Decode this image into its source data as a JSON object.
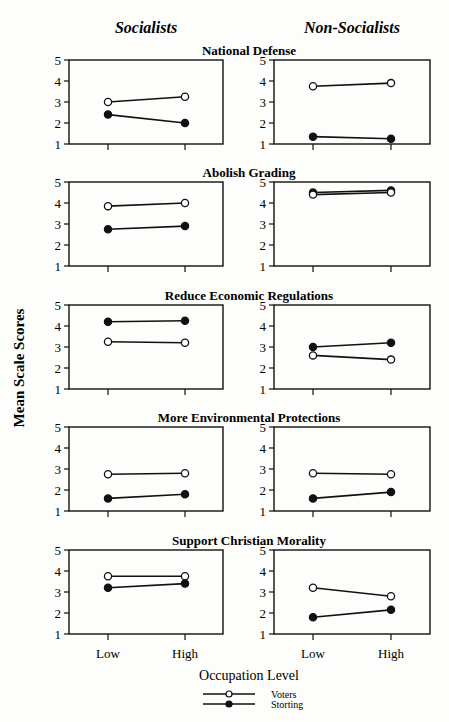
{
  "chart_data": {
    "type": "line",
    "ylabel": "Mean Scale Scores",
    "xlabel": "Occupation Level",
    "categories": [
      "Low",
      "High"
    ],
    "ylim": [
      1,
      5
    ],
    "yticks": [
      1,
      2,
      3,
      4,
      5
    ],
    "columns": [
      "Socialists",
      "Non-Socialists"
    ],
    "legend": [
      {
        "name": "Voters",
        "marker": "open-circle"
      },
      {
        "name": "Storting",
        "marker": "filled-circle"
      }
    ],
    "panels": [
      {
        "title": "National Defense",
        "Socialists": {
          "Voters": [
            3.0,
            3.25
          ],
          "Storting": [
            2.4,
            2.0
          ]
        },
        "Non-Socialists": {
          "Voters": [
            3.75,
            3.9
          ],
          "Storting": [
            1.35,
            1.25
          ]
        }
      },
      {
        "title": "Abolish Grading",
        "Socialists": {
          "Voters": [
            3.85,
            4.0
          ],
          "Storting": [
            2.75,
            2.9
          ]
        },
        "Non-Socialists": {
          "Voters": [
            4.4,
            4.5
          ],
          "Storting": [
            4.5,
            4.6
          ]
        }
      },
      {
        "title": "Reduce Economic Regulations",
        "Socialists": {
          "Voters": [
            3.25,
            3.2
          ],
          "Storting": [
            4.2,
            4.25
          ]
        },
        "Non-Socialists": {
          "Voters": [
            2.6,
            2.4
          ],
          "Storting": [
            3.0,
            3.2
          ]
        }
      },
      {
        "title": "More Environmental Protections",
        "Socialists": {
          "Voters": [
            2.75,
            2.8
          ],
          "Storting": [
            1.6,
            1.8
          ]
        },
        "Non-Socialists": {
          "Voters": [
            2.8,
            2.75
          ],
          "Storting": [
            1.6,
            1.9
          ]
        }
      },
      {
        "title": "Support Christian Morality",
        "Socialists": {
          "Voters": [
            3.75,
            3.75
          ],
          "Storting": [
            3.2,
            3.4
          ]
        },
        "Non-Socialists": {
          "Voters": [
            3.2,
            2.8
          ],
          "Storting": [
            1.8,
            2.15
          ]
        }
      }
    ]
  }
}
